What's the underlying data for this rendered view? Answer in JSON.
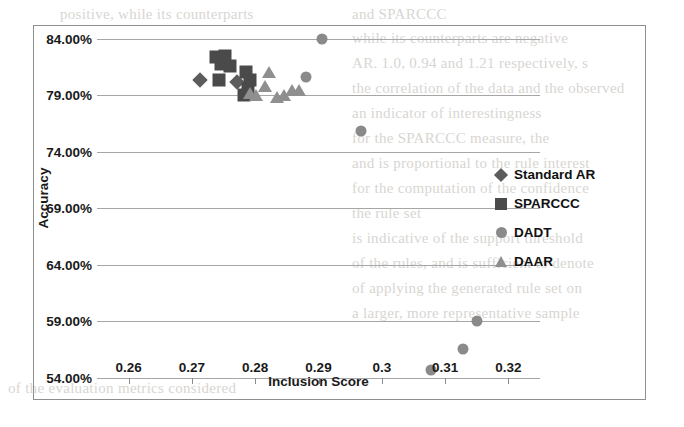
{
  "background_text": {
    "lines": [
      {
        "x": 60,
        "y": 2,
        "text": "positive, while its counterparts"
      },
      {
        "x": 352,
        "y": 2,
        "text": "and SPARCCC"
      },
      {
        "x": 352,
        "y": 26,
        "text": "while its counterparts are negative"
      },
      {
        "x": 352,
        "y": 51,
        "text": "AR. 1.0, 0.94 and 1.21 respectively, s"
      },
      {
        "x": 352,
        "y": 76,
        "text": "the correlation of the data and the observed"
      },
      {
        "x": 352,
        "y": 101,
        "text": "an indicator of interestingness"
      },
      {
        "x": 352,
        "y": 126,
        "text": "for the SPARCCC measure, the"
      },
      {
        "x": 352,
        "y": 151,
        "text": "and is proportional to the rule interest"
      },
      {
        "x": 352,
        "y": 176,
        "text": "for the computation of the confidence"
      },
      {
        "x": 352,
        "y": 201,
        "text": "the rule set"
      },
      {
        "x": 352,
        "y": 226,
        "text": "is indicative of the support threshold"
      },
      {
        "x": 352,
        "y": 251,
        "text": "of the rules, and is sufficient to denote"
      },
      {
        "x": 352,
        "y": 276,
        "text": "of applying the generated rule set on"
      },
      {
        "x": 352,
        "y": 301,
        "text": "a larger, more representative sample"
      },
      {
        "x": 8,
        "y": 376,
        "text": "of the evaluation metrics considered"
      }
    ]
  },
  "chart_data": {
    "type": "scatter",
    "title": "",
    "xlabel": "Inclusion Score",
    "ylabel": "Accuracy",
    "xlim": [
      0.255,
      0.325
    ],
    "ylim": [
      0.54,
      0.855
    ],
    "xticks": [
      "0.26",
      "0.27",
      "0.28",
      "0.29",
      "0.3",
      "0.31",
      "0.32"
    ],
    "xtick_values": [
      0.26,
      0.27,
      0.28,
      0.29,
      0.3,
      0.31,
      0.32
    ],
    "yticks": [
      "84.00%",
      "79.00%",
      "74.00%",
      "69.00%",
      "64.00%",
      "59.00%",
      "54.00%"
    ],
    "ytick_values": [
      0.84,
      0.79,
      0.74,
      0.69,
      0.64,
      0.59,
      0.54
    ],
    "grid": true,
    "grid_axis": "y",
    "legend_position": "right",
    "series": [
      {
        "name": "Standard AR",
        "marker": "diamond",
        "color": "#5c5c5c",
        "points": [
          {
            "x": 0.2713,
            "y": 0.8035
          },
          {
            "x": 0.2772,
            "y": 0.802
          }
        ]
      },
      {
        "name": "SPARCCC",
        "marker": "square",
        "color": "#4a4a4a",
        "points": [
          {
            "x": 0.2738,
            "y": 0.824
          },
          {
            "x": 0.2752,
            "y": 0.8245
          },
          {
            "x": 0.2746,
            "y": 0.8175
          },
          {
            "x": 0.276,
            "y": 0.8165
          },
          {
            "x": 0.2743,
            "y": 0.804
          },
          {
            "x": 0.2786,
            "y": 0.8105
          },
          {
            "x": 0.2792,
            "y": 0.804
          },
          {
            "x": 0.2788,
            "y": 0.7955
          },
          {
            "x": 0.2783,
            "y": 0.7905
          }
        ]
      },
      {
        "name": "DADT",
        "marker": "circle",
        "color": "#8a8a8a",
        "points": [
          {
            "x": 0.2905,
            "y": 0.84
          },
          {
            "x": 0.288,
            "y": 0.8065
          },
          {
            "x": 0.2967,
            "y": 0.7585
          },
          {
            "x": 0.3077,
            "y": 0.547
          },
          {
            "x": 0.315,
            "y": 0.59
          },
          {
            "x": 0.3128,
            "y": 0.566
          }
        ]
      },
      {
        "name": "DAAR",
        "marker": "triangle",
        "color": "#8f8f8f",
        "points": [
          {
            "x": 0.2822,
            "y": 0.8105
          },
          {
            "x": 0.2815,
            "y": 0.798
          },
          {
            "x": 0.2858,
            "y": 0.7945
          },
          {
            "x": 0.2869,
            "y": 0.7945
          },
          {
            "x": 0.2845,
            "y": 0.79
          },
          {
            "x": 0.2834,
            "y": 0.7885
          },
          {
            "x": 0.2801,
            "y": 0.7905
          },
          {
            "x": 0.2791,
            "y": 0.792
          }
        ]
      }
    ]
  },
  "legend": {
    "items": [
      {
        "label": "Standard AR",
        "marker": "diamond"
      },
      {
        "label": "SPARCCC",
        "marker": "square"
      },
      {
        "label": "DADT",
        "marker": "circle"
      },
      {
        "label": "DAAR",
        "marker": "triangle"
      }
    ]
  }
}
